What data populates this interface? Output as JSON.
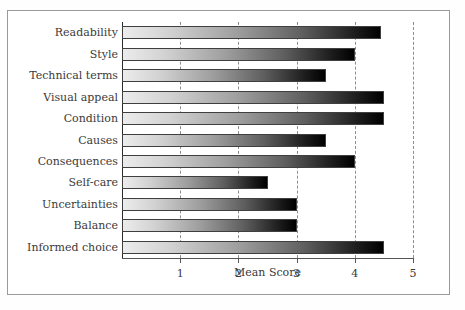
{
  "chart_data": {
    "type": "bar",
    "orientation": "horizontal",
    "title": "",
    "xlabel": "Mean Score",
    "ylabel": "",
    "xlim": [
      0,
      5
    ],
    "xticks": [
      "1",
      "2",
      "3",
      "4",
      "5"
    ],
    "grid": "vertical-dashed",
    "legend": "none",
    "categories": [
      "Readability",
      "Style",
      "Technical terms",
      "Visual appeal",
      "Condition",
      "Causes",
      "Consequences",
      "Self-care",
      "Uncertainties",
      "Balance",
      "Informed choice"
    ],
    "values": [
      4.45,
      4.0,
      3.5,
      4.5,
      4.5,
      3.5,
      4.0,
      2.5,
      3.0,
      3.0,
      4.5
    ],
    "bar_style": {
      "gradient_from": "#ececec",
      "gradient_to": "#000000",
      "outline": "#3f3f3f"
    },
    "axis_color": "#2b2b2b",
    "gridline_color": "#8d8d8d",
    "text_color": "#3a3a3a",
    "background": "#ffffff"
  }
}
